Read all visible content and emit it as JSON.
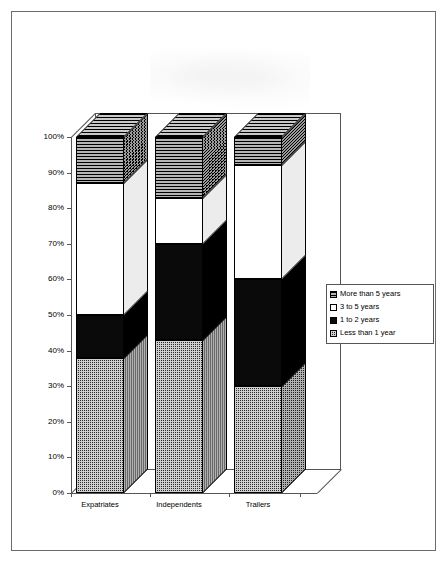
{
  "chart_data": {
    "type": "bar",
    "subtype": "stacked-100-percent-3d",
    "title": "",
    "xlabel": "",
    "ylabel": "",
    "ylim": [
      0,
      100
    ],
    "ytick_labels": [
      "100%",
      "90%",
      "80%",
      "70%",
      "60%",
      "50%",
      "40%",
      "30%",
      "20%",
      "10%",
      "0%"
    ],
    "ytick_values": [
      100,
      90,
      80,
      70,
      60,
      50,
      40,
      30,
      20,
      10,
      0
    ],
    "grid": false,
    "legend_position": "right",
    "categories": [
      "Expatriates",
      "Independents",
      "Trailers"
    ],
    "series": [
      {
        "name": "More than 5 years",
        "values": [
          13,
          17,
          8
        ]
      },
      {
        "name": "3 to 5 years",
        "values": [
          37,
          13,
          32
        ]
      },
      {
        "name": "1 to 2 years",
        "values": [
          12,
          27,
          30
        ]
      },
      {
        "name": "Less than 1 year",
        "values": [
          38,
          43,
          30
        ]
      }
    ],
    "stack_order_bottom_to_top": [
      "Less than 1 year",
      "1 to 2 years",
      "3 to 5 years",
      "More than 5 years"
    ]
  },
  "legend": {
    "items": [
      {
        "label": "More than 5 years",
        "swatch": "horizontal-hatch-grey"
      },
      {
        "label": "3 to 5 years",
        "swatch": "white-empty"
      },
      {
        "label": "1 to 2 years",
        "swatch": "solid-black"
      },
      {
        "label": "Less than 1 year",
        "swatch": "fine-crosshatch-dark"
      }
    ]
  },
  "axis": {
    "y_ticks": [
      "100%",
      "90%",
      "80%",
      "70%",
      "60%",
      "50%",
      "40%",
      "30%",
      "20%",
      "10%",
      "0%"
    ],
    "x_categories": [
      "Expatriates",
      "Independents",
      "Trailers"
    ]
  }
}
